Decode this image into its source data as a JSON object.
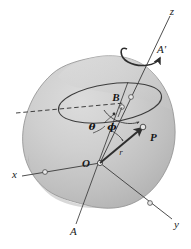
{
  "figure": {
    "background_color": "#ffffff",
    "body_fill_light": "#d2d2d2",
    "body_fill_mid": "#c4c4c4",
    "body_fill_dark": "#b0b0b0",
    "body_outline": "#8a8a8a",
    "line_color": "#3a3a3a",
    "label_color": "#1a1a1a"
  },
  "labels": {
    "axis_z": "z",
    "axis_x": "x",
    "axis_y": "y",
    "axis_A": "A",
    "axis_A_prime": "A'",
    "point_O": "O",
    "point_P": "P",
    "point_B": "B",
    "angle_theta": "θ",
    "angle_phi": "ϕ",
    "radius_r": "r"
  },
  "elements": {
    "rotation_arrow": "rotation-arrow",
    "dashed_reference_line": "dashed-reference-line",
    "latitude_circle": "latitude-circle",
    "radius_vector": "radius-vector",
    "rigid_body": "rigid-body-blob"
  }
}
